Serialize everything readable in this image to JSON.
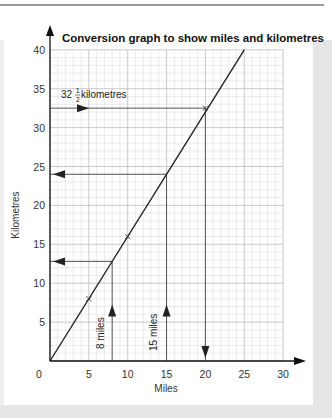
{
  "chart_data": {
    "type": "line",
    "title": "Conversion graph to show miles and kilometres",
    "xlabel": "Miles",
    "ylabel": "Kilometres",
    "xlim": [
      0,
      30
    ],
    "ylim": [
      0,
      40
    ],
    "x_ticks": [
      0,
      5,
      10,
      15,
      20,
      25,
      30
    ],
    "y_ticks": [
      5,
      10,
      15,
      20,
      25,
      30,
      35,
      40
    ],
    "grid": true,
    "grid_step": 1,
    "series": [
      {
        "name": "conversion line",
        "x": [
          0,
          25
        ],
        "y": [
          0,
          40
        ],
        "color": "#222222"
      }
    ],
    "markers": [
      {
        "x": 5,
        "y": 8,
        "symbol": "x"
      },
      {
        "x": 10,
        "y": 16,
        "symbol": "x"
      },
      {
        "x": 20,
        "y": 32.5,
        "symbol": "x"
      }
    ],
    "annotations": [
      {
        "label": "32½ kilometres",
        "from": [
          0,
          32.5
        ],
        "to": [
          20,
          32.5
        ],
        "then_down_to": [
          20,
          0
        ],
        "direction": "right-then-down",
        "answer_miles": 20
      },
      {
        "label": "15 miles",
        "from": [
          15,
          0
        ],
        "to": [
          15,
          24
        ],
        "then_left_to": [
          0,
          24
        ],
        "direction": "up-then-left",
        "answer_km": 24
      },
      {
        "label": "8 miles",
        "from": [
          8,
          0
        ],
        "to": [
          8,
          12.8
        ],
        "then_left_to": [
          0,
          12.8
        ],
        "direction": "up-then-left",
        "answer_km": 12.8
      }
    ]
  },
  "text": {
    "title": "Conversion graph to show miles and kilometres",
    "xlabel": "Miles",
    "ylabel": "Kilometres",
    "origin": "0",
    "annot_km_whole": "32",
    "annot_km_num": "1",
    "annot_km_den": "2",
    "annot_km_unit": "kilometres",
    "annot_15": "15 miles",
    "annot_8": "8 miles"
  },
  "colors": {
    "grid_minor": "#d9d9d9",
    "grid_major": "#bdbdbd",
    "axis": "#111111",
    "guide": "#555555"
  }
}
